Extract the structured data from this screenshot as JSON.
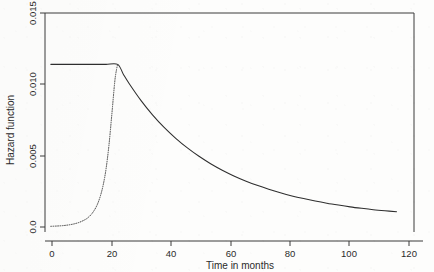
{
  "chart_data": {
    "type": "line",
    "title": "",
    "xlabel": "Time in months",
    "ylabel": "Hazard function",
    "xlim": [
      -1,
      126
    ],
    "ylim": [
      -0.0004,
      0.0158
    ],
    "xticks": [
      0,
      20,
      40,
      60,
      80,
      100,
      120
    ],
    "xticklabels": [
      "0",
      "20",
      "40",
      "60",
      "80",
      "100",
      "120"
    ],
    "yticks": [
      0.0,
      0.005,
      0.01,
      0.015
    ],
    "yticklabels": [
      "0.0",
      "0.005",
      "0.010",
      "0.015"
    ],
    "grid": false,
    "legend": "none",
    "series": [
      {
        "name": "piecewise-hazard-solid",
        "style": "solid",
        "color": "#2e2e2e",
        "x": [
          1,
          4,
          8,
          12,
          16,
          20,
          24,
          26,
          28,
          32,
          36,
          40,
          44,
          48,
          52,
          56,
          60,
          64,
          68,
          72,
          76,
          80,
          84,
          88,
          92,
          96,
          100,
          104,
          108,
          112,
          116,
          120
        ],
        "y": [
          0.012,
          0.012,
          0.012,
          0.012,
          0.012,
          0.012,
          0.012,
          0.01125,
          0.01057,
          0.00934,
          0.00827,
          0.00734,
          0.00653,
          0.00582,
          0.0052,
          0.00465,
          0.00417,
          0.00375,
          0.00338,
          0.00305,
          0.00276,
          0.0025,
          0.00227,
          0.00207,
          0.00189,
          0.00173,
          0.00159,
          0.00146,
          0.00135,
          0.00125,
          0.00117,
          0.0011
        ]
      },
      {
        "name": "weibull-hazard-dotted",
        "style": "dotted",
        "color": "#444444",
        "x": [
          1,
          3,
          5,
          7,
          9,
          11,
          13,
          14,
          15,
          16,
          17,
          18,
          19,
          20,
          21,
          22,
          23,
          23.6,
          24
        ],
        "y": [
          2e-05,
          4e-05,
          7e-05,
          0.00012,
          0.0002,
          0.00033,
          0.00054,
          0.0007,
          0.00092,
          0.00122,
          0.00163,
          0.00222,
          0.00305,
          0.00425,
          0.006,
          0.0083,
          0.0107,
          0.0116,
          0.012
        ]
      }
    ]
  },
  "axes": {
    "x_title": "Time in months",
    "y_title": "Hazard function"
  }
}
